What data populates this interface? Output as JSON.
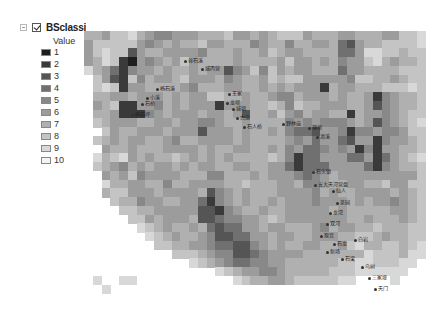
{
  "toc": {
    "layer_name": "BSclassi",
    "layer_checked": true,
    "field_header": "Value",
    "legend": [
      {
        "label": "1",
        "color": "#1e1e1e"
      },
      {
        "label": "2",
        "color": "#3a3a3a"
      },
      {
        "label": "3",
        "color": "#555555"
      },
      {
        "label": "4",
        "color": "#707070"
      },
      {
        "label": "5",
        "color": "#888888"
      },
      {
        "label": "6",
        "color": "#9c9c9c"
      },
      {
        "label": "7",
        "color": "#b0b0b0"
      },
      {
        "label": "8",
        "color": "#c4c4c4"
      },
      {
        "label": "9",
        "color": "#d8d8d8"
      },
      {
        "label": "10",
        "color": "#f4f4f4"
      }
    ]
  },
  "map": {
    "cell_size": 8.75,
    "grid": [
      "0000000000000000000000000000000000000000",
      "7768897655666777866767888677766777668890",
      "6888886567677866777567757766743677888890",
      "6898836776666577767768766777744699887880",
      "6798216567686777767777686676756689767780",
      "9764256676776766356858676677746677778880",
      "0863285766786667567768788666665887767880",
      "0898266777765777667767676662766777888980",
      "0776676667676688776776557666767762567780",
      "0678226657676662666778758776667763567780",
      "0776222567666766763776865766772766567880",
      "0876667766766556776777756565556763567890",
      "0086776667666366676776754436652556556880",
      "0876766776577666676777765646643662566780",
      "0067767776666767766776756445656252667780",
      "0978967677876767677778752446664462467890",
      "0876576766767667766776642444666642567780",
      "0067685666677755777676665456766666666680",
      "0097766775776666778777667556776677866880",
      "0078866676666735676777666657677666676780",
      "0008775667766425676776766656667676656780",
      "0000887766666332567767766666767777766780",
      "0000088676667334556678766666667767776780",
      "0000009876776743446676677765766778777880",
      "0000000987677653344667667766677887677880",
      "0000000088776654433567677667768977887890",
      "0000000000888765533456666777777798887990",
      "0000000000009876544556677777788998889900",
      "0000000000000009876655677777888999999000",
      "0900990000000000098776678888899000090000",
      "0090000000000000000000000000000000000000",
      "0000000000000000000000000000000000000000"
    ],
    "places": [
      {
        "label": "谷石溪",
        "x": 188,
        "y": 57
      },
      {
        "label": "城丙营",
        "x": 205,
        "y": 65
      },
      {
        "label": "杨石溪",
        "x": 160,
        "y": 85
      },
      {
        "label": "小溪",
        "x": 150,
        "y": 94
      },
      {
        "label": "石桥",
        "x": 145,
        "y": 100
      },
      {
        "label": "杨石坪",
        "x": 135,
        "y": 111
      },
      {
        "label": "王家",
        "x": 232,
        "y": 90
      },
      {
        "label": "龙坝",
        "x": 230,
        "y": 99
      },
      {
        "label": "城坝",
        "x": 236,
        "y": 105
      },
      {
        "label": "古庙",
        "x": 240,
        "y": 114
      },
      {
        "label": "石人桥",
        "x": 247,
        "y": 123
      },
      {
        "label": "野林庙",
        "x": 286,
        "y": 120
      },
      {
        "label": "蒲坝",
        "x": 312,
        "y": 124
      },
      {
        "label": "清溪",
        "x": 320,
        "y": 133
      },
      {
        "label": "石头镇",
        "x": 316,
        "y": 168
      },
      {
        "label": "五大天河营盘",
        "x": 318,
        "y": 181
      },
      {
        "label": "仙人",
        "x": 336,
        "y": 187
      },
      {
        "label": "茶园",
        "x": 340,
        "y": 199
      },
      {
        "label": "龙湾",
        "x": 333,
        "y": 209
      },
      {
        "label": "双河",
        "x": 330,
        "y": 220
      },
      {
        "label": "观音",
        "x": 324,
        "y": 232
      },
      {
        "label": "石龙",
        "x": 337,
        "y": 240
      },
      {
        "label": "白岩",
        "x": 358,
        "y": 236
      },
      {
        "label": "新场",
        "x": 330,
        "y": 248
      },
      {
        "label": "石梁",
        "x": 345,
        "y": 255
      },
      {
        "label": "乌树",
        "x": 365,
        "y": 263
      },
      {
        "label": "三家垭",
        "x": 372,
        "y": 274
      },
      {
        "label": "天门",
        "x": 378,
        "y": 285
      }
    ]
  }
}
